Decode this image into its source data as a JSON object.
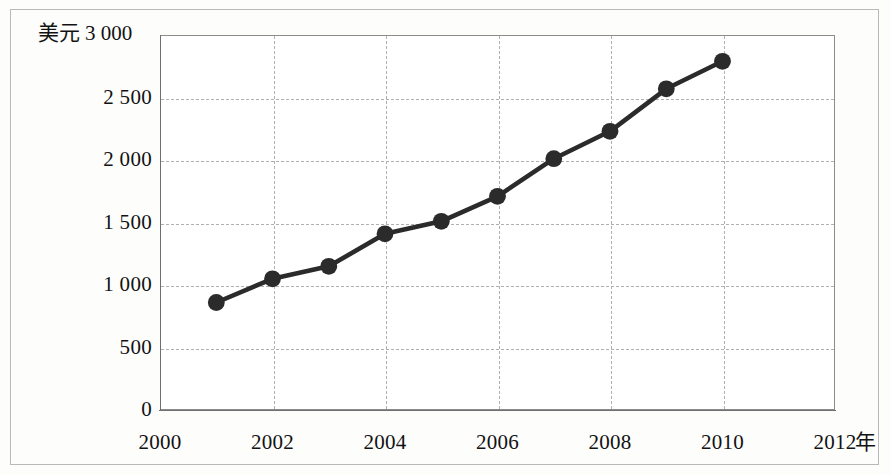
{
  "chart_data": {
    "type": "line",
    "title": "",
    "subtitle": "",
    "xlabel": "年",
    "ylabel": "美元",
    "x": [
      2001,
      2002,
      2003,
      2004,
      2005,
      2006,
      2007,
      2008,
      2009,
      2010
    ],
    "values": [
      860,
      1050,
      1150,
      1410,
      1510,
      1710,
      2010,
      2230,
      2570,
      2790
    ],
    "series": [
      {
        "name": "美元",
        "values": [
          860,
          1050,
          1150,
          1410,
          1510,
          1710,
          2010,
          2230,
          2570,
          2790
        ]
      }
    ],
    "xlim": [
      2000,
      2012
    ],
    "ylim": [
      0,
      3000
    ],
    "xticks": [
      2000,
      2002,
      2004,
      2006,
      2008,
      2010,
      2012
    ],
    "xtick_labels": [
      "2000",
      "2002",
      "2004",
      "2006",
      "2008",
      "2010",
      "2012"
    ],
    "yticks": [
      0,
      500,
      1000,
      1500,
      2000,
      2500,
      3000
    ],
    "ytick_labels": [
      "0",
      "500",
      "1 000",
      "1 500",
      "2 000",
      "2 500",
      "3 000"
    ],
    "grid": true,
    "legend": "none",
    "line_color": "#2b2b2b",
    "marker": "circle",
    "marker_color": "#2b2b2b"
  },
  "axes": {
    "y_unit_label": "美元",
    "y_top_tick_label": "3 000",
    "x_unit_label": "年"
  }
}
